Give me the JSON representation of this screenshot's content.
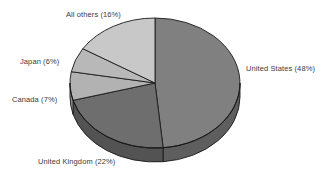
{
  "chart_data": {
    "type": "pie",
    "title": "",
    "subtitle": "",
    "xlabel": "",
    "ylabel": "",
    "legend_position": "none",
    "grid": false,
    "three_d": true,
    "start_angle_deg": 0,
    "direction": "clockwise",
    "categories": [
      "United States",
      "United Kingdom",
      "Canada",
      "Japan",
      "All others"
    ],
    "values": [
      48,
      22,
      7,
      6,
      16
    ],
    "unit": "%",
    "labels": [
      "United States (48%)",
      "United Kingdom (22%)",
      "Canada (7%)",
      "Japan (6%)",
      "All others (16%)"
    ],
    "slice_colors": [
      "#808080",
      "#6e6e6e",
      "#b2b2b2",
      "#b8b8b8",
      "#c8c8c8"
    ],
    "slice_side_colors": [
      "#5e5e5e",
      "#535353",
      "#8a8a8a",
      "#8f8f8f",
      "#9b9b9b"
    ],
    "outline_color": "#1a1a1a",
    "background": "#ffffff",
    "text_color": "#3a3a3a"
  },
  "labels": {
    "united_states": "United States (48%)",
    "united_kingdom": "United Kingdom (22%)",
    "canada": "Canada (7%)",
    "japan": "Japan (6%)",
    "all_others": "All others (16%)"
  }
}
